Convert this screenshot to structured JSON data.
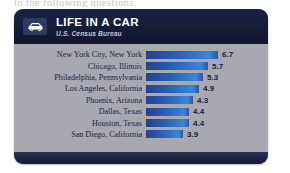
{
  "page": {
    "cutoff_text": "to the following questions."
  },
  "card": {
    "header": {
      "icon": "car-icon",
      "title": "LIFE IN A CAR",
      "subtitle": "U.S. Census Bureau"
    },
    "colors": {
      "card_background": "#a7a8b0",
      "header_navy": "#161c38",
      "bar_blue_dark": "#27418b",
      "bar_blue_light": "#3b86d8",
      "label_text": "#20243f"
    }
  },
  "chart_data": {
    "type": "bar",
    "orientation": "horizontal",
    "title": "LIFE IN A CAR",
    "subtitle": "U.S. Census Bureau",
    "xlabel": "",
    "ylabel": "",
    "grid": false,
    "legend": false,
    "xlim": [
      0,
      7.2
    ],
    "categories": [
      "New York City, New York",
      "Chicago, Illinois",
      "Philadelphia, Pennsylvania",
      "Los Angeles, California",
      "Phoenix, Arizona",
      "Dallas, Texas",
      "Houston, Texas",
      "San Diego, California"
    ],
    "values": [
      6.7,
      5.7,
      5.3,
      4.9,
      4.3,
      4.4,
      4.4,
      3.9
    ],
    "value_labels": [
      "6.7",
      "5.7",
      "5.3",
      "4.9",
      "4.3",
      "4.4",
      "4.4",
      "3.9"
    ],
    "bar_pixel_widths": [
      72,
      62,
      57,
      53,
      47,
      43,
      43,
      37
    ],
    "rows": [
      {
        "label": "New York City, New York",
        "value": 6.7,
        "value_label": "6.7",
        "bar_px": 72
      },
      {
        "label": "Chicago, Illinois",
        "value": 5.7,
        "value_label": "5.7",
        "bar_px": 62
      },
      {
        "label": "Philadelphia, Pennsylvania",
        "value": 5.3,
        "value_label": "5.3",
        "bar_px": 57
      },
      {
        "label": "Los Angeles, California",
        "value": 4.9,
        "value_label": "4.9",
        "bar_px": 53
      },
      {
        "label": "Phoenix, Arizona",
        "value": 4.3,
        "value_label": "4.3",
        "bar_px": 47
      },
      {
        "label": "Dallas, Texas",
        "value": 4.4,
        "value_label": "4.4",
        "bar_px": 43
      },
      {
        "label": "Houston, Texas",
        "value": 4.4,
        "value_label": "4.4",
        "bar_px": 43
      },
      {
        "label": "San Diego, California",
        "value": 3.9,
        "value_label": "3.9",
        "bar_px": 37
      }
    ]
  }
}
